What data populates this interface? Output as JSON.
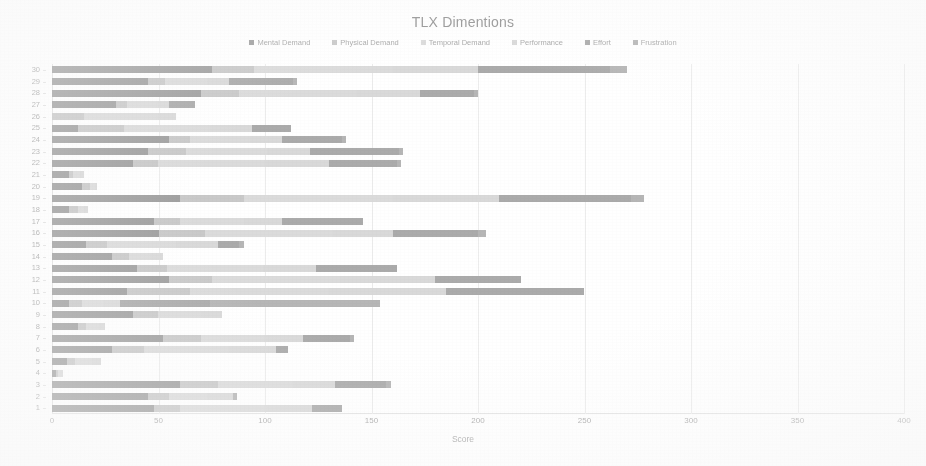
{
  "chart_data": {
    "type": "bar",
    "orientation": "horizontal",
    "stacked": true,
    "title": "TLX Dimentions",
    "xlabel": "Score",
    "ylabel": "Participants",
    "xlim": [
      0,
      400
    ],
    "xticks": [
      0,
      50,
      100,
      150,
      200,
      250,
      300,
      350,
      400
    ],
    "grid": true,
    "legend_position": "top",
    "categories": [
      "30",
      "29",
      "28",
      "27",
      "26",
      "25",
      "24",
      "23",
      "22",
      "21",
      "20",
      "19",
      "18",
      "17",
      "16",
      "15",
      "14",
      "13",
      "12",
      "11",
      "10",
      "9",
      "8",
      "7",
      "6",
      "5",
      "4",
      "3",
      "2",
      "1"
    ],
    "series": [
      {
        "name": "Mental Demand",
        "color": "#7d7d7d",
        "values": [
          75,
          45,
          70,
          30,
          0,
          12,
          55,
          45,
          38,
          8,
          14,
          60,
          8,
          48,
          50,
          16,
          28,
          40,
          55,
          35,
          8,
          38,
          12,
          52,
          28,
          7,
          2,
          60,
          45,
          48
        ]
      },
      {
        "name": "Physical Demand",
        "color": "#b9b9b9",
        "values": [
          20,
          8,
          18,
          5,
          15,
          22,
          10,
          18,
          12,
          2,
          4,
          30,
          4,
          12,
          22,
          10,
          8,
          14,
          20,
          30,
          6,
          12,
          4,
          18,
          15,
          4,
          1,
          18,
          10,
          12
        ]
      },
      {
        "name": "Temporal Demand",
        "color": "#d2d2d2",
        "values": [
          65,
          20,
          55,
          15,
          35,
          40,
          28,
          38,
          50,
          3,
          2,
          70,
          3,
          30,
          60,
          32,
          10,
          45,
          60,
          65,
          10,
          20,
          6,
          30,
          40,
          8,
          1,
          35,
          18,
          40
        ]
      },
      {
        "name": "Performance",
        "color": "#cfcfcf",
        "values": [
          40,
          10,
          30,
          5,
          8,
          20,
          15,
          20,
          30,
          2,
          1,
          50,
          2,
          18,
          28,
          20,
          6,
          25,
          45,
          55,
          8,
          10,
          3,
          18,
          22,
          4,
          1,
          20,
          12,
          22
        ]
      },
      {
        "name": "Effort",
        "color": "#8f8f8f",
        "values": [
          62,
          30,
          25,
          12,
          0,
          18,
          28,
          42,
          32,
          0,
          0,
          62,
          0,
          38,
          40,
          10,
          0,
          38,
          40,
          65,
          42,
          0,
          0,
          22,
          6,
          0,
          0,
          24,
          0,
          14
        ]
      },
      {
        "name": "Frustration",
        "color": "#9e9e9e",
        "values": [
          8,
          2,
          2,
          0,
          0,
          0,
          2,
          2,
          2,
          0,
          0,
          6,
          0,
          0,
          4,
          2,
          0,
          0,
          0,
          0,
          80,
          0,
          0,
          2,
          0,
          0,
          0,
          2,
          2,
          0
        ]
      }
    ],
    "totals": [
      270,
      115,
      188,
      65,
      100,
      112,
      138,
      165,
      164,
      15,
      21,
      278,
      17,
      148,
      204,
      90,
      52,
      162,
      220,
      250,
      154,
      80,
      25,
      142,
      111,
      23,
      5,
      159,
      87,
      136
    ]
  },
  "legend": {
    "items": [
      {
        "label": "Mental Demand"
      },
      {
        "label": "Physical Demand"
      },
      {
        "label": "Temporal Demand"
      },
      {
        "label": "Performance"
      },
      {
        "label": "Effort"
      },
      {
        "label": "Frustration"
      }
    ]
  }
}
